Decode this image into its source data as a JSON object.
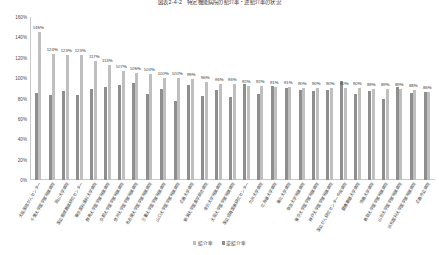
{
  "chart_data": {
    "type": "bar",
    "title": "図表2-4-2　特定機能病院の紹介率・逆紹介率の状況",
    "xlabel": "",
    "ylabel": "",
    "ylim": [
      0,
      160
    ],
    "ytick_labels": [
      "160%",
      "140%",
      "120%",
      "100%",
      "80%",
      "60%",
      "40%",
      "20%",
      "0%"
    ],
    "ytick_values": [
      160,
      140,
      120,
      100,
      80,
      60,
      40,
      20,
      0
    ],
    "grid": false,
    "legend_position": "bottom",
    "legend": [
      "紹介率",
      "逆紹介率"
    ],
    "categories": [
      "大阪国際がんセンター",
      "千葉大学医学部附属病院",
      "岡山大学病院",
      "国立循環器病研究センター",
      "東京医科歯科大学病院",
      "群馬大学医学部附属病院",
      "京都大学医学部附属病院",
      "信州大学医学部附属病院",
      "名古屋大学医学部附属病院",
      "三重大学医学部附属病院",
      "山口大学医学部附属病院",
      "広島大学病院",
      "新潟大学医歯学総合病院",
      "金沢大学附属病院",
      "大阪大学医学部附属病院",
      "国立成育医療研究センター",
      "九州大学病院",
      "北海道大学病院",
      "東北大学病院",
      "筑波大学附属病院",
      "東京大学医学部附属病院",
      "神戸大学医学部附属病院",
      "国立がん研究センター中央病院",
      "慶應義塾大学病院",
      "徳島大学病院",
      "鳥取大学医学部附属病院",
      "山形大学医学部附属病院",
      "浜松医科大学医学部附属病院",
      "広島市立病院"
    ],
    "series": [
      {
        "name": "紹介率",
        "color": "#bfbfbf",
        "values": [
          145,
          124,
          123,
          123,
          117,
          113,
          107,
          105,
          104,
          100,
          100,
          99,
          96,
          94,
          94,
          92,
          92,
          91,
          91,
          90,
          90,
          90,
          90,
          90,
          89,
          89,
          89,
          88,
          86
        ],
        "labels": [
          "145%",
          "124%",
          "123%",
          "123%",
          "117%",
          "113%",
          "107%",
          "105%",
          "104%",
          "100%",
          "100%",
          "99%",
          "96%",
          "94%",
          "94%",
          "92%",
          "92%",
          "91%",
          "91%",
          "90%",
          "90%",
          "90%",
          "90%",
          "90%",
          "89%",
          "89%",
          "89%",
          "88%",
          "86%"
        ]
      },
      {
        "name": "逆紹介率",
        "color": "#8e8e8e",
        "values": [
          85,
          83,
          87,
          83,
          89,
          91,
          93,
          95,
          84,
          89,
          78,
          93,
          82,
          88,
          81,
          94,
          84,
          92,
          90,
          88,
          87,
          88,
          97,
          84,
          87,
          80,
          91,
          85,
          86
        ]
      }
    ]
  },
  "legend": {
    "items": [
      {
        "label": "紹介率",
        "swatch": "shoukai"
      },
      {
        "label": "逆紹介率",
        "swatch": "gyaku"
      }
    ]
  }
}
